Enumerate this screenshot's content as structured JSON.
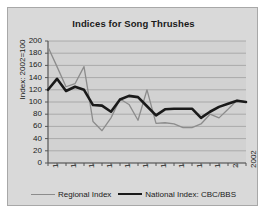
{
  "chart_data": {
    "type": "line",
    "title": "Indices for Song Thrushes",
    "xlabel": "",
    "ylabel": "Index: 2002=100",
    "xlim": [
      1980,
      2002
    ],
    "ylim": [
      0,
      200
    ],
    "ytick_step": 20,
    "yticks": [
      200,
      180,
      160,
      140,
      120,
      100,
      80,
      60,
      40,
      20,
      0
    ],
    "xticks_labeled": [
      1980,
      1982,
      1984,
      1986,
      1988,
      1990,
      1992,
      1994,
      1996,
      1998,
      2000,
      2002
    ],
    "x": [
      1980,
      1981,
      1982,
      1983,
      1984,
      1985,
      1986,
      1987,
      1988,
      1989,
      1990,
      1991,
      1992,
      1993,
      1994,
      1995,
      1996,
      1997,
      1998,
      1999,
      2000,
      2001,
      2002
    ],
    "grid": "horizontal",
    "legend_position": "bottom",
    "series": [
      {
        "name": "Regional Index",
        "color": "#8c8c8c",
        "width": 1.3,
        "values": [
          190,
          158,
          125,
          130,
          158,
          68,
          53,
          74,
          105,
          96,
          70,
          120,
          65,
          66,
          64,
          58,
          58,
          64,
          80,
          74,
          88,
          103,
          100
        ]
      },
      {
        "name": "National Index: CBC/BBS",
        "color": "#1a1a1a",
        "width": 2.6,
        "values": [
          120,
          138,
          118,
          125,
          120,
          95,
          94,
          84,
          104,
          110,
          108,
          93,
          78,
          88,
          89,
          89,
          89,
          74,
          84,
          92,
          97,
          102,
          100
        ]
      }
    ]
  },
  "legend": {
    "items": [
      {
        "label": "Regional Index",
        "swatch": "thin-gray-line"
      },
      {
        "label": "National Index: CBC/BBS",
        "swatch": "thick-black-line"
      }
    ]
  },
  "colors": {
    "figure_background": "#d9d9d9",
    "frame_border": "#a8a8a8",
    "plot_background": "#d2d2d2",
    "gridline": "#9a9a9a",
    "axis": "#555555",
    "text": "#1a1a1a",
    "regional_series": "#8c8c8c",
    "national_series": "#1a1a1a"
  }
}
